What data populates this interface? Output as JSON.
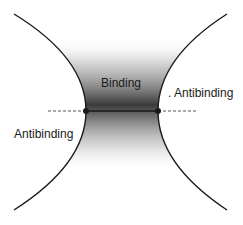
{
  "diagram": {
    "labels": {
      "binding": "Binding",
      "antibinding_right": ". Antibinding",
      "antibinding_left": "Antibinding"
    },
    "colors": {
      "curve": "#1a1a1a",
      "shading_dark": "#3a3a3a",
      "background": "#ffffff"
    },
    "nodes": [
      {
        "name": "left-vertex",
        "x": 86,
        "y": 111
      },
      {
        "name": "right-vertex",
        "x": 158,
        "y": 111
      }
    ]
  }
}
